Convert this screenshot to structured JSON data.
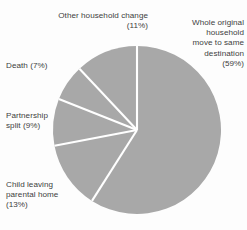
{
  "chart_data": {
    "type": "pie",
    "title": "",
    "subtitle": "",
    "xlabel": "",
    "ylabel": "",
    "legend_position": "none",
    "grid": false,
    "start_angle_deg": 0,
    "direction": "clockwise",
    "units": "percent",
    "total": 100,
    "categories": [
      "Whole original household move to same destination",
      "Child leaving parental home",
      "Partnership split",
      "Death",
      "Other household change"
    ],
    "values": [
      59,
      13,
      9,
      7,
      11
    ],
    "slices": [
      {
        "name": "whole-original-household",
        "label": "Whole original\nhousehold\nmove to same\ndestination\n(59%)",
        "value": 59,
        "percent_text": "(59%)",
        "start_deg": 0,
        "end_deg": 212.4,
        "color": "#a8a8a8"
      },
      {
        "name": "child-leaving-parental-home",
        "label": "Child leaving\nparental home\n(13%)",
        "value": 13,
        "percent_text": "(13%)",
        "start_deg": 212.4,
        "end_deg": 259.2,
        "color": "#a8a8a8"
      },
      {
        "name": "partnership-split",
        "label": "Partnership\nsplit (9%)",
        "value": 9,
        "percent_text": "(9%)",
        "start_deg": 259.2,
        "end_deg": 291.6,
        "color": "#a8a8a8"
      },
      {
        "name": "death",
        "label": "Death (7%)",
        "value": 7,
        "percent_text": "(7%)",
        "start_deg": 291.6,
        "end_deg": 316.8,
        "color": "#a8a8a8"
      },
      {
        "name": "other-household-change",
        "label": "Other household change\n(11%)",
        "value": 11,
        "percent_text": "(11%)",
        "start_deg": 316.8,
        "end_deg": 360,
        "color": "#a8a8a8"
      }
    ]
  },
  "labels": {
    "other_household_change": "Other household change\n(11%)",
    "whole_original_household": "Whole original\nhousehold\nmove to same\ndestination\n(59%)",
    "death": "Death (7%)",
    "partnership_split": "Partnership\nsplit (9%)",
    "child_leaving_parental_home": "Child leaving\nparental home\n(13%)"
  },
  "colors": {
    "slice_fill": "#a8a8a8",
    "slice_separator": "#ffffff",
    "text": "#3e3e3e",
    "background": "#fdfdfd"
  },
  "geometry": {
    "center_x": 137,
    "center_y": 130,
    "radius": 84
  }
}
